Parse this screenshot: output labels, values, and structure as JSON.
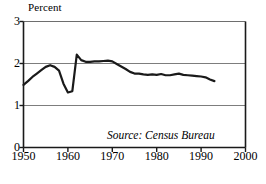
{
  "chart_data": {
    "type": "line",
    "title": "",
    "subtitle": "",
    "xlabel": "",
    "ylabel": "Percent",
    "ylabel_position": "top-left",
    "xlim": [
      1950,
      2000
    ],
    "ylim": [
      0,
      3
    ],
    "grid": true,
    "gridlines_y": [
      1,
      2,
      3
    ],
    "legend": "none",
    "xticks": [
      1950,
      1960,
      1970,
      1980,
      1990,
      2000
    ],
    "xticklabels": [
      "1950",
      "1960",
      "1970",
      "1980",
      "1990",
      "2000"
    ],
    "yticks": [
      0,
      1,
      2,
      3
    ],
    "yticklabels": [
      "0",
      "1",
      "2",
      "3"
    ],
    "annotations": [
      {
        "text": "Source: Census Bureau",
        "x": 1985,
        "y": 0.28,
        "style": "italic"
      }
    ],
    "series": [
      {
        "name": "Percent",
        "color": "#1a1a1a",
        "x": [
          1950,
          1951,
          1952,
          1953,
          1954,
          1955,
          1956,
          1957,
          1958,
          1959,
          1960,
          1961,
          1962,
          1963,
          1964,
          1965,
          1966,
          1967,
          1968,
          1969,
          1970,
          1971,
          1972,
          1973,
          1974,
          1975,
          1976,
          1977,
          1978,
          1979,
          1980,
          1981,
          1982,
          1983,
          1984,
          1985,
          1986,
          1987,
          1988,
          1989,
          1990,
          1991,
          1992,
          1993
        ],
        "values": [
          1.49,
          1.58,
          1.68,
          1.76,
          1.84,
          1.92,
          1.96,
          1.92,
          1.83,
          1.52,
          1.31,
          1.34,
          2.21,
          2.08,
          2.04,
          2.04,
          2.05,
          2.05,
          2.06,
          2.07,
          2.05,
          1.99,
          1.93,
          1.87,
          1.8,
          1.76,
          1.76,
          1.74,
          1.73,
          1.74,
          1.73,
          1.75,
          1.72,
          1.72,
          1.74,
          1.76,
          1.73,
          1.72,
          1.71,
          1.7,
          1.69,
          1.67,
          1.62,
          1.58
        ]
      }
    ]
  },
  "figure": {
    "background": "#ffffff",
    "axis_color": "#1a1a1a",
    "grid_color": "#6e6e6e",
    "line_color": "#1a1a1a",
    "line_width": 2.2
  }
}
